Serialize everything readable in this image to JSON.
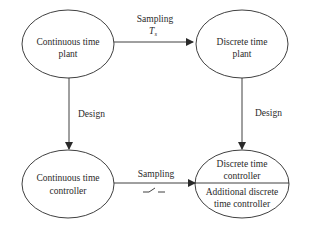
{
  "nodes": {
    "continuous_plant": {
      "line1": "Continuous time",
      "line2": "plant"
    },
    "discrete_plant": {
      "line1": "Discrete time",
      "line2": "plant"
    },
    "continuous_controller": {
      "line1": "Continuous time",
      "line2": "controller"
    },
    "discrete_controller": {
      "upper_line1": "Discrete time",
      "upper_line2": "controller",
      "lower_line1": "Additional discrete",
      "lower_line2": "time controller"
    }
  },
  "edges": {
    "top_sampling": {
      "label": "Sampling",
      "symbol": "T",
      "subscript": "s"
    },
    "left_design": {
      "label": "Design"
    },
    "right_design": {
      "label": "Design"
    },
    "bottom_sampling": {
      "label": "Sampling",
      "switch_symbol": "sampling-switch"
    }
  },
  "colors": {
    "stroke": "#2a2a2a",
    "background": "#ffffff"
  }
}
